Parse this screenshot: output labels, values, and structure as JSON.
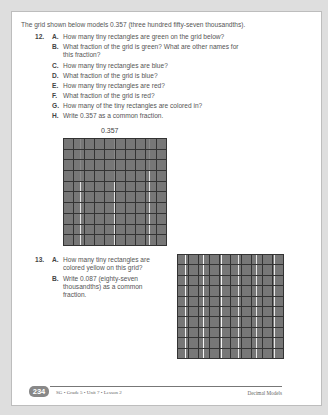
{
  "intro": "The grid shown below models 0.357 (three hundred fifty-seven thousandths).",
  "questions": [
    {
      "number": "12.",
      "parts": [
        {
          "letter": "A.",
          "lines": [
            "How many tiny rectangles are green on the grid below?"
          ]
        },
        {
          "letter": "B.",
          "lines": [
            "What fraction of the grid is green? What are other names for",
            "this fraction?"
          ]
        },
        {
          "letter": "C.",
          "lines": [
            "How many tiny rectangles are blue?"
          ]
        },
        {
          "letter": "D.",
          "lines": [
            "What fraction of the grid is blue?"
          ]
        },
        {
          "letter": "E.",
          "lines": [
            "How many tiny rectangles are red?"
          ]
        },
        {
          "letter": "F.",
          "lines": [
            "What fraction of the grid is red?"
          ]
        },
        {
          "letter": "G.",
          "lines": [
            "How many of the tiny rectangles are colored in?"
          ]
        },
        {
          "letter": "H.",
          "lines": [
            "Write 0.357 as a common fraction."
          ]
        }
      ]
    },
    {
      "number": "13.",
      "parts": [
        {
          "letter": "A.",
          "lines": [
            "How many tiny rectangles are",
            "colored yellow on this grid?"
          ]
        },
        {
          "letter": "B.",
          "lines": [
            "Write 0.087 (eighty-seven",
            "thousandths) as a common",
            "fraction."
          ]
        }
      ]
    }
  ],
  "grid1": {
    "label": "0.357",
    "colors": {
      "green": "#8a8a8a",
      "blue": "#2e2e2e",
      "red": "#5a5a5a",
      "empty": "#e4e4e4",
      "yellow": "#d0d0d0"
    }
  },
  "footer": {
    "page_number": "234",
    "left": "SG • Grade 5 • Unit 7 • Lesson 2",
    "right": "Decimal Models"
  }
}
